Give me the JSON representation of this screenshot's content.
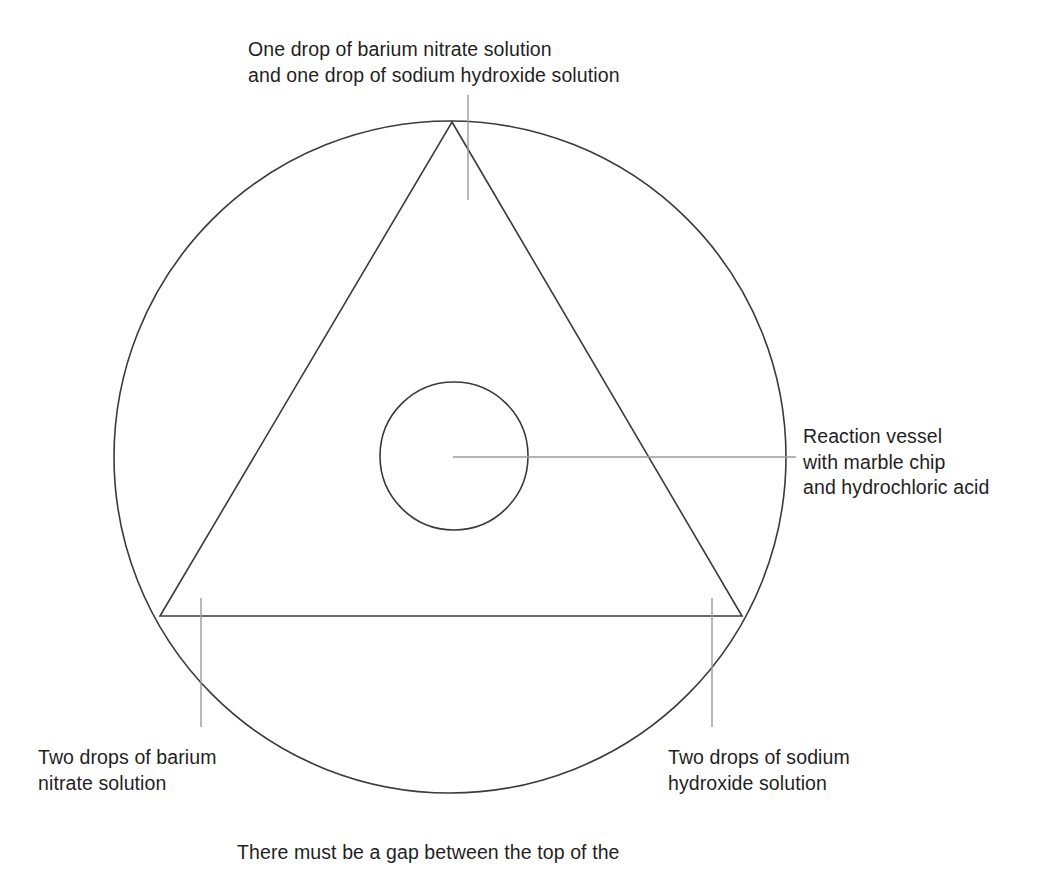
{
  "figure": {
    "colors": {
      "background": "#ffffff",
      "outline": "#3a3a3a",
      "leader": "#9a9a9a",
      "text": "#1f1f1f"
    },
    "shapes": {
      "outer_circle": {
        "name": "outer-circle",
        "cx": 450,
        "cy": 457,
        "r": 336
      },
      "inner_circle": {
        "name": "inner-circle",
        "cx": 454,
        "cy": 456,
        "r": 74
      },
      "triangle": {
        "name": "triangle",
        "apex": {
          "x": 452,
          "y": 122
        },
        "bottom_left": {
          "x": 160,
          "y": 616
        },
        "bottom_right": {
          "x": 742,
          "y": 616
        }
      },
      "leaders": [
        {
          "name": "leader-top",
          "x1": 468,
          "y1": 95,
          "x2": 468,
          "y2": 200
        },
        {
          "name": "leader-right",
          "x1": 453,
          "y1": 457,
          "x2": 796,
          "y2": 457
        },
        {
          "name": "leader-bottom-left",
          "x1": 201,
          "y1": 598,
          "x2": 201,
          "y2": 727
        },
        {
          "name": "leader-bottom-right",
          "x1": 712,
          "y1": 598,
          "x2": 712,
          "y2": 727
        }
      ]
    }
  },
  "labels": {
    "top": "One drop of barium nitrate solution\nand one drop of sodium hydroxide solution",
    "right": "Reaction vessel\nwith marble chip\nand hydrochloric acid",
    "bottom_left": "Two drops of barium\nnitrate solution",
    "bottom_right": "Two drops of sodium\nhydroxide solution"
  },
  "caption": "There must be a gap between the top of the"
}
